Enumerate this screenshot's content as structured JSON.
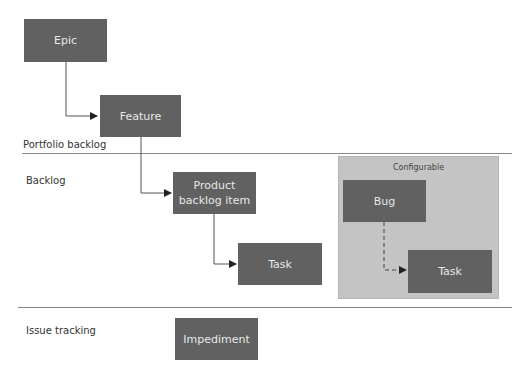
{
  "sections": [
    {
      "label": "Portfolio backlog"
    },
    {
      "label": "Backlog"
    },
    {
      "label": "Issue tracking"
    }
  ],
  "configurable": {
    "title": "Configurable"
  },
  "nodes": {
    "epic": "Epic",
    "feature": "Feature",
    "pbi": "Product backlog item",
    "task": "Task",
    "bug": "Bug",
    "bug_task": "Task",
    "impediment": "Impediment"
  },
  "colors": {
    "box": "#616161",
    "box_text": "#e8e8e8",
    "configurable_bg": "#c4c4c4",
    "divider": "#8a8a8a"
  }
}
